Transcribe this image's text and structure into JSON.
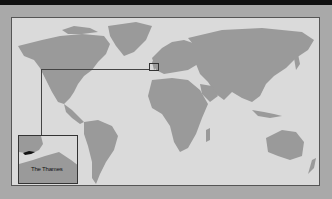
{
  "map": {
    "title": "World map",
    "land_color": "#9a9a9a",
    "ocean_color": "#dadada",
    "frame_color": "#a9a9a9",
    "highlight": {
      "region": "Southern England / London",
      "inset_label": "The Thames"
    }
  }
}
